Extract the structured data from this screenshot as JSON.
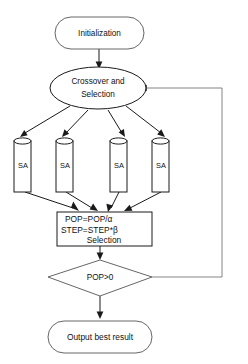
{
  "diagram": {
    "type": "flowchart",
    "canvas": {
      "width": 248,
      "height": 364,
      "background": "#ffffff"
    },
    "stroke_color": "#1a1a1a",
    "text_color": "#111111",
    "nodes": [
      {
        "id": "initialization",
        "shape": "rounded-rectangle",
        "label": "Initialization"
      },
      {
        "id": "crossover-selection",
        "shape": "ellipse",
        "label_line1": "Crossover and",
        "label_line2": "Selection"
      },
      {
        "id": "sa-1",
        "shape": "cylinder",
        "label": "SA"
      },
      {
        "id": "sa-2",
        "shape": "cylinder",
        "label": "SA"
      },
      {
        "id": "sa-3",
        "shape": "cylinder",
        "label": "SA"
      },
      {
        "id": "sa-4",
        "shape": "cylinder",
        "label": "SA"
      },
      {
        "id": "update-process",
        "shape": "rectangle",
        "label_line1": "POP=POP/α",
        "label_line2": "STEP=STEP*β",
        "label_line3": "Selection"
      },
      {
        "id": "decision-pop",
        "shape": "diamond",
        "label": "POP>0"
      },
      {
        "id": "output-best-result",
        "shape": "rounded-rectangle",
        "label": "Output best result"
      }
    ],
    "edges": [
      {
        "id": "edge-init-to-crossover",
        "from": "initialization",
        "to": "crossover-selection",
        "label": ""
      },
      {
        "id": "edge-crossover-to-sa-1",
        "from": "crossover-selection",
        "to": "sa-1",
        "label": ""
      },
      {
        "id": "edge-crossover-to-sa-2",
        "from": "crossover-selection",
        "to": "sa-2",
        "label": ""
      },
      {
        "id": "edge-crossover-to-sa-3",
        "from": "crossover-selection",
        "to": "sa-3",
        "label": ""
      },
      {
        "id": "edge-crossover-to-sa-4",
        "from": "crossover-selection",
        "to": "sa-4",
        "label": ""
      },
      {
        "id": "edge-sa-1-to-update",
        "from": "sa-1",
        "to": "update-process",
        "label": ""
      },
      {
        "id": "edge-sa-2-to-update",
        "from": "sa-2",
        "to": "update-process",
        "label": ""
      },
      {
        "id": "edge-sa-3-to-update",
        "from": "sa-3",
        "to": "update-process",
        "label": ""
      },
      {
        "id": "edge-sa-4-to-update",
        "from": "sa-4",
        "to": "update-process",
        "label": ""
      },
      {
        "id": "edge-update-to-decision",
        "from": "update-process",
        "to": "decision-pop",
        "label": ""
      },
      {
        "id": "edge-decision-to-output",
        "from": "decision-pop",
        "to": "output-best-result",
        "label": ""
      },
      {
        "id": "edge-decision-feedback-to-crossover",
        "from": "decision-pop",
        "to": "crossover-selection",
        "label": ""
      }
    ]
  }
}
